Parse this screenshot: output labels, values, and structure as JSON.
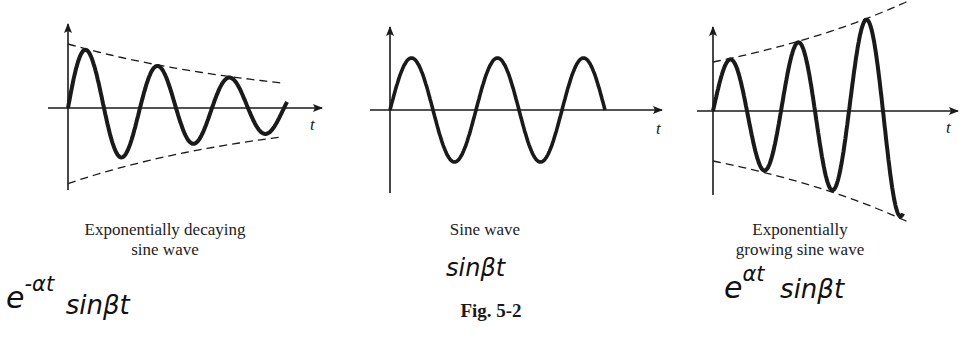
{
  "figure": {
    "label": "Fig. 5-2",
    "panels": [
      {
        "id": "decaying",
        "caption_line1": "Exponentially decaying",
        "caption_line2": "sine wave",
        "axis_label": "t",
        "handwritten_base": "e",
        "handwritten_exp": "-αt",
        "handwritten_tail": "sinβt",
        "envelope": "exponential decay",
        "cycles": 3
      },
      {
        "id": "sine",
        "caption_line1": "Sine wave",
        "caption_line2": "",
        "axis_label": "t",
        "handwritten_base": "",
        "handwritten_exp": "",
        "handwritten_tail": "sinβt",
        "envelope": "none",
        "cycles": 2.5
      },
      {
        "id": "growing",
        "caption_line1": "Exponentially",
        "caption_line2": "growing sine wave",
        "axis_label": "t",
        "handwritten_base": "e",
        "handwritten_exp": "αt",
        "handwritten_tail": "sinβt",
        "envelope": "exponential growth",
        "cycles": 2.75
      }
    ]
  },
  "colors": {
    "ink": "#1a1a1a",
    "paper": "#ffffff"
  }
}
